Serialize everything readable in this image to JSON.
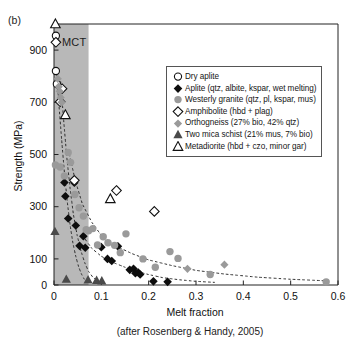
{
  "panel_label": "(b)",
  "mct_label": "MCT",
  "credit": "(after Rosenberg & Handy, 2005)",
  "legend": {
    "items": [
      {
        "marker": "open-circle",
        "label": "Dry aplite"
      },
      {
        "marker": "filled-diamond",
        "label": "Aplite (qtz, albite, kspar, wet melting)"
      },
      {
        "marker": "gray-circle",
        "label": "Westerly granite (qtz, pl, kspar, mus)"
      },
      {
        "marker": "open-diamond",
        "label": "Amphibolite (hbd + plag)"
      },
      {
        "marker": "gray-diamond",
        "label": "Orthogneiss (27% bio, 42% qtz)"
      },
      {
        "marker": "filled-triangle",
        "label": "Two mica schist (21% mus, 7% bio)"
      },
      {
        "marker": "open-triangle",
        "label": "Metadiorite (hbd + czo, minor gar)"
      }
    ]
  },
  "chart_data": {
    "type": "scatter",
    "title": "",
    "xlabel": "Melt fraction",
    "ylabel": "Strength (MPa)",
    "xlim": [
      0,
      0.6
    ],
    "ylim": [
      0,
      1000
    ],
    "xticks": [
      0,
      0.1,
      0.2,
      0.3,
      0.4,
      0.5,
      0.6
    ],
    "xticklabels": [
      "0",
      "0.1",
      "0.2",
      "0.3",
      "0.4",
      "0.5",
      "0.6"
    ],
    "yticks": [
      0,
      100,
      300,
      500,
      700,
      900
    ],
    "yticklabels": [
      "0",
      "100",
      "300",
      "500",
      "700",
      "900"
    ],
    "grid": false,
    "legend_position": "upper-right",
    "shaded_band": {
      "label": "MCT",
      "x_start": 0.0,
      "x_end": 0.073,
      "color": "#b8b8b8"
    },
    "annotations": [
      "(b)",
      "MCT",
      "(after Rosenberg & Handy, 2005)"
    ],
    "series": [
      {
        "name": "Dry aplite",
        "marker": "open-circle",
        "color": "#ffffff",
        "edge": "#111111",
        "points": [
          {
            "x": 0.004,
            "y": 955
          },
          {
            "x": 0.004,
            "y": 820
          },
          {
            "x": 0.006,
            "y": 770
          }
        ]
      },
      {
        "name": "Aplite (qtz, albite, kspar, wet melting)",
        "marker": "filled-diamond",
        "color": "#0d0d0d",
        "points": [
          {
            "x": 0.022,
            "y": 393
          },
          {
            "x": 0.024,
            "y": 340
          },
          {
            "x": 0.03,
            "y": 255
          },
          {
            "x": 0.043,
            "y": 392
          },
          {
            "x": 0.046,
            "y": 228
          },
          {
            "x": 0.054,
            "y": 150
          },
          {
            "x": 0.062,
            "y": 187
          },
          {
            "x": 0.066,
            "y": 143
          },
          {
            "x": 0.1,
            "y": 145
          },
          {
            "x": 0.113,
            "y": 100
          },
          {
            "x": 0.122,
            "y": 92
          },
          {
            "x": 0.135,
            "y": 148
          },
          {
            "x": 0.16,
            "y": 58
          },
          {
            "x": 0.168,
            "y": 62
          },
          {
            "x": 0.172,
            "y": 45
          },
          {
            "x": 0.178,
            "y": 48
          },
          {
            "x": 0.182,
            "y": 40
          },
          {
            "x": 0.21,
            "y": 14
          },
          {
            "x": 0.24,
            "y": 12
          }
        ]
      },
      {
        "name": "Westerly granite (qtz, pl, kspar, mus)",
        "marker": "gray-circle",
        "color": "#9a9a9a",
        "points": [
          {
            "x": 0.003,
            "y": 460
          },
          {
            "x": 0.013,
            "y": 452
          },
          {
            "x": 0.03,
            "y": 508
          },
          {
            "x": 0.035,
            "y": 470
          },
          {
            "x": 0.022,
            "y": 418
          },
          {
            "x": 0.044,
            "y": 347
          },
          {
            "x": 0.053,
            "y": 296
          },
          {
            "x": 0.062,
            "y": 264
          },
          {
            "x": 0.068,
            "y": 212
          },
          {
            "x": 0.073,
            "y": 208
          },
          {
            "x": 0.082,
            "y": 216
          },
          {
            "x": 0.092,
            "y": 153
          },
          {
            "x": 0.104,
            "y": 185
          },
          {
            "x": 0.114,
            "y": 162
          },
          {
            "x": 0.128,
            "y": 152
          },
          {
            "x": 0.14,
            "y": 124
          },
          {
            "x": 0.152,
            "y": 196
          },
          {
            "x": 0.188,
            "y": 100
          },
          {
            "x": 0.214,
            "y": 68
          },
          {
            "x": 0.245,
            "y": 128
          },
          {
            "x": 0.262,
            "y": 102
          },
          {
            "x": 0.33,
            "y": 40
          },
          {
            "x": 0.575,
            "y": 12
          }
        ]
      },
      {
        "name": "Amphibolite (hbd + plag)",
        "marker": "open-diamond",
        "color": "#ffffff",
        "edge": "#111111",
        "points": [
          {
            "x": 0.004,
            "y": 930
          },
          {
            "x": 0.017,
            "y": 752
          },
          {
            "x": 0.013,
            "y": 702
          },
          {
            "x": 0.043,
            "y": 401
          },
          {
            "x": 0.132,
            "y": 362
          },
          {
            "x": 0.212,
            "y": 282
          }
        ]
      },
      {
        "name": "Orthogneiss (27% bio, 42% qtz)",
        "marker": "gray-diamond",
        "color": "#9a9a9a",
        "points": [
          {
            "x": 0.008,
            "y": 790
          },
          {
            "x": 0.01,
            "y": 760
          },
          {
            "x": 0.012,
            "y": 742
          },
          {
            "x": 0.014,
            "y": 718
          },
          {
            "x": 0.016,
            "y": 700
          },
          {
            "x": 0.282,
            "y": 62
          },
          {
            "x": 0.36,
            "y": 78
          }
        ]
      },
      {
        "name": "Two mica schist (21% mus, 7% bio)",
        "marker": "filled-triangle",
        "color": "#4a4a4a",
        "points": [
          {
            "x": 0.002,
            "y": 205
          },
          {
            "x": 0.026,
            "y": 22
          },
          {
            "x": 0.072,
            "y": 20
          },
          {
            "x": 0.09,
            "y": 18
          },
          {
            "x": 0.101,
            "y": 16
          }
        ]
      },
      {
        "name": "Metadiorite (hbd + czo, minor gar)",
        "marker": "open-triangle",
        "color": "#ffffff",
        "edge": "#111111",
        "points": [
          {
            "x": 0.003,
            "y": 1000
          },
          {
            "x": 0.024,
            "y": 652
          },
          {
            "x": 0.119,
            "y": 330
          }
        ]
      }
    ],
    "trend_curves": [
      {
        "name": "steep-left-curve",
        "style": "dashed",
        "path": [
          [
            0.006,
            810
          ],
          [
            0.01,
            700
          ],
          [
            0.016,
            560
          ],
          [
            0.022,
            430
          ],
          [
            0.028,
            320
          ],
          [
            0.034,
            230
          ],
          [
            0.04,
            160
          ],
          [
            0.046,
            110
          ],
          [
            0.052,
            70
          ],
          [
            0.058,
            42
          ],
          [
            0.064,
            22
          ],
          [
            0.07,
            10
          ]
        ]
      },
      {
        "name": "inner-dashed-curve",
        "style": "dashed",
        "path": [
          [
            0.014,
            780
          ],
          [
            0.02,
            640
          ],
          [
            0.027,
            490
          ],
          [
            0.034,
            370
          ],
          [
            0.041,
            270
          ],
          [
            0.049,
            190
          ],
          [
            0.057,
            130
          ],
          [
            0.065,
            85
          ],
          [
            0.073,
            52
          ],
          [
            0.082,
            30
          ],
          [
            0.092,
            16
          ]
        ]
      },
      {
        "name": "outer-decay-curve",
        "style": "dashed",
        "path": [
          [
            0.03,
            520
          ],
          [
            0.045,
            400
          ],
          [
            0.06,
            310
          ],
          [
            0.08,
            240
          ],
          [
            0.1,
            190
          ],
          [
            0.13,
            150
          ],
          [
            0.165,
            120
          ],
          [
            0.2,
            96
          ],
          [
            0.25,
            74
          ],
          [
            0.3,
            56
          ],
          [
            0.36,
            42
          ],
          [
            0.43,
            30
          ],
          [
            0.5,
            22
          ],
          [
            0.575,
            16
          ]
        ]
      },
      {
        "name": "lower-decay-curve",
        "style": "dashed",
        "path": [
          [
            0.06,
            190
          ],
          [
            0.08,
            140
          ],
          [
            0.1,
            110
          ],
          [
            0.125,
            86
          ],
          [
            0.15,
            68
          ],
          [
            0.175,
            52
          ],
          [
            0.2,
            40
          ],
          [
            0.23,
            28
          ],
          [
            0.265,
            20
          ],
          [
            0.3,
            14
          ],
          [
            0.34,
            10
          ]
        ]
      }
    ]
  }
}
